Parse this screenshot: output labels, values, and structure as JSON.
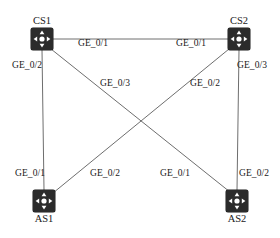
{
  "diagram": {
    "background_color": "#ffffff",
    "link_color": "#6e6e6e",
    "node_color": "#2b2b2b",
    "text_color": "#1a1a1a",
    "nodes": [
      {
        "id": "CS1",
        "label": "CS1",
        "x": 42,
        "y": 39,
        "label_position": "above",
        "icon": "router-icon"
      },
      {
        "id": "CS2",
        "label": "CS2",
        "x": 239,
        "y": 39,
        "label_position": "above",
        "icon": "router-icon"
      },
      {
        "id": "AS1",
        "label": "AS1",
        "x": 44,
        "y": 201,
        "label_position": "below",
        "icon": "router-icon"
      },
      {
        "id": "AS2",
        "label": "AS2",
        "x": 237,
        "y": 201,
        "label_position": "below",
        "icon": "router-icon"
      }
    ],
    "links": [
      {
        "id": "cs1-cs2",
        "from": "CS1",
        "to": "CS2",
        "x1": 53,
        "y1": 39,
        "x2": 228,
        "y2": 39
      },
      {
        "id": "cs1-as1",
        "from": "CS1",
        "to": "AS1",
        "x1": 42,
        "y1": 50,
        "x2": 44,
        "y2": 190
      },
      {
        "id": "cs2-as2",
        "from": "CS2",
        "to": "AS2",
        "x1": 239,
        "y1": 50,
        "x2": 237,
        "y2": 190
      },
      {
        "id": "cs1-as2",
        "from": "CS1",
        "to": "AS2",
        "x1": 51,
        "y1": 49,
        "x2": 230,
        "y2": 192
      },
      {
        "id": "cs2-as1",
        "from": "CS2",
        "to": "AS1",
        "x1": 229,
        "y1": 49,
        "x2": 53,
        "y2": 193
      }
    ],
    "edge_labels": [
      {
        "id": "cs1-port-1",
        "text": "GE_0/1",
        "node": "CS1",
        "link": "cs1-cs2",
        "x": 78,
        "y": 38
      },
      {
        "id": "cs2-port-1",
        "text": "GE_0/1",
        "node": "CS2",
        "link": "cs1-cs2",
        "x": 176,
        "y": 38
      },
      {
        "id": "cs1-port-2",
        "text": "GE_0/2",
        "node": "CS1",
        "link": "cs1-as1",
        "x": 12,
        "y": 60
      },
      {
        "id": "cs1-port-3",
        "text": "GE_0/3",
        "node": "CS1",
        "link": "cs1-as2",
        "x": 100,
        "y": 78
      },
      {
        "id": "cs2-port-2",
        "text": "GE_0/2",
        "node": "CS2",
        "link": "cs2-as1",
        "x": 190,
        "y": 78
      },
      {
        "id": "cs2-port-3",
        "text": "GE_0/3",
        "node": "CS2",
        "link": "cs2-as2",
        "x": 237,
        "y": 60
      },
      {
        "id": "as1-port-1",
        "text": "GE_0/1",
        "node": "AS1",
        "link": "cs1-as1",
        "x": 15,
        "y": 168
      },
      {
        "id": "as1-port-2",
        "text": "GE_0/2",
        "node": "AS1",
        "link": "cs2-as1",
        "x": 90,
        "y": 168
      },
      {
        "id": "as2-port-1",
        "text": "GE_0/1",
        "node": "AS2",
        "link": "cs1-as2",
        "x": 160,
        "y": 168
      },
      {
        "id": "as2-port-2",
        "text": "GE_0/2",
        "node": "AS2",
        "link": "cs2-as2",
        "x": 239,
        "y": 168
      }
    ]
  }
}
